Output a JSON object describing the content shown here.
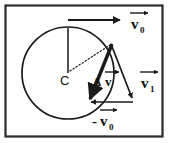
{
  "figure": {
    "background_color": "#ffffff",
    "stroke_color": "#1a1a1a",
    "border_color": "#2b2b2b"
  },
  "center": {
    "label": "C",
    "x": 68,
    "y": 73
  },
  "circle": {
    "radius": 46,
    "cx": 68,
    "cy": 73
  },
  "labels": {
    "v0_initial": {
      "symbol": "v",
      "subscript": "0",
      "prefix": "",
      "full": "v0"
    },
    "v1_final": {
      "symbol": "v",
      "subscript": "1",
      "prefix": "",
      "full": "v1"
    },
    "v0_negative": {
      "symbol": "v",
      "subscript": "0",
      "prefix": "-",
      "full": "-v0"
    },
    "delta_v": {
      "symbol": "v",
      "subscript": "",
      "prefix": "Δ",
      "full": "Δv"
    }
  },
  "vectors": [
    {
      "name": "v0",
      "description": "initial velocity, tangent at top of circle, pointing right",
      "x1": 68,
      "y1": 20,
      "x2": 123,
      "y2": 20
    },
    {
      "name": "v1",
      "description": "final velocity, tangent at right of circle, pointing down-right",
      "x1": 111,
      "y1": 44,
      "x2": 134,
      "y2": 100
    },
    {
      "name": "-v0",
      "description": "negative of initial velocity, pointing left",
      "x1": 133,
      "y1": 102,
      "x2": 88,
      "y2": 102
    },
    {
      "name": "delta-v",
      "description": "change in velocity, from tangent point down-left toward circle center direction",
      "x1": 112,
      "y1": 44,
      "x2": 88,
      "y2": 101
    }
  ],
  "construction_lines": [
    {
      "name": "radius-vertical",
      "style": "solid",
      "x1": 68,
      "y1": 73,
      "x2": 68,
      "y2": 27
    },
    {
      "name": "radius-dotted",
      "style": "dotted",
      "x1": 68,
      "y1": 73,
      "x2": 110,
      "y2": 45
    }
  ]
}
